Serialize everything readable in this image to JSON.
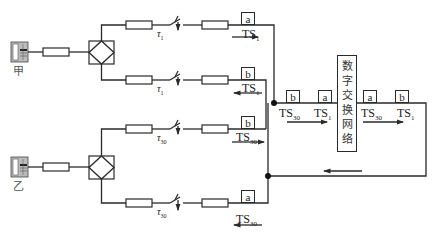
{
  "phones": [
    {
      "label": "甲",
      "icon": "telephone-icon"
    },
    {
      "label": "乙",
      "icon": "telephone-icon"
    }
  ],
  "switches": {
    "upper_top": {
      "tau": "τ",
      "sub": "1"
    },
    "upper_bottom": {
      "tau": "τ",
      "sub": "1"
    },
    "lower_top": {
      "tau": "τ",
      "sub": "30"
    },
    "lower_bottom": {
      "tau": "τ",
      "sub": "30"
    }
  },
  "branches": {
    "upper_top": {
      "cell": "a",
      "ts": "TS",
      "ts_sub": "1",
      "arrow": "right"
    },
    "upper_bottom": {
      "cell": "b",
      "ts": "TS",
      "ts_sub": "1",
      "arrow": "left"
    },
    "lower_top": {
      "cell": "b",
      "ts": "TS",
      "ts_sub": "30",
      "arrow": "right"
    },
    "lower_bottom": {
      "cell": "a",
      "ts": "TS",
      "ts_sub": "30",
      "arrow": "left"
    }
  },
  "highway_in": [
    {
      "cell": "b",
      "ts": "TS",
      "ts_sub": "30"
    },
    {
      "cell": "a",
      "ts": "TS",
      "ts_sub": "1"
    }
  ],
  "highway_out": [
    {
      "cell": "a",
      "ts": "TS",
      "ts_sub": "30"
    },
    {
      "cell": "b",
      "ts": "TS",
      "ts_sub": "1"
    }
  ],
  "network": {
    "label": "数字交换网络"
  },
  "colors": {
    "line": "#2a2a2a",
    "background": "#ffffff"
  }
}
